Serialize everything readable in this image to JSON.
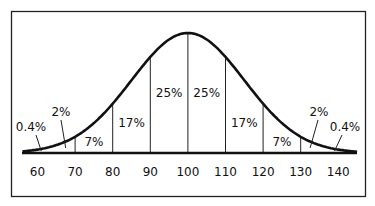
{
  "chart_data": {
    "type": "area",
    "title": "",
    "xlabel": "",
    "ylabel": "",
    "distribution": "normal",
    "mean": 100,
    "sd": 15,
    "x_ticks": [
      60,
      70,
      80,
      90,
      100,
      110,
      120,
      130,
      140
    ],
    "xlim": [
      56,
      145
    ],
    "divider_x": [
      70,
      80,
      90,
      100,
      110,
      120,
      130
    ],
    "regions": [
      {
        "label": "0.4%",
        "from": 55,
        "to": 60,
        "leader_to": 61
      },
      {
        "label": "2%",
        "from": 60,
        "to": 70,
        "leader_to": 67
      },
      {
        "label": "7%",
        "from": 70,
        "to": 80
      },
      {
        "label": "17%",
        "from": 80,
        "to": 90
      },
      {
        "label": "25%",
        "from": 90,
        "to": 100
      },
      {
        "label": "25%",
        "from": 100,
        "to": 110
      },
      {
        "label": "17%",
        "from": 110,
        "to": 120
      },
      {
        "label": "7%",
        "from": 120,
        "to": 130
      },
      {
        "label": "2%",
        "from": 130,
        "to": 140,
        "leader_to": 133
      },
      {
        "label": "0.4%",
        "from": 140,
        "to": 145,
        "leader_to": 139
      }
    ]
  }
}
